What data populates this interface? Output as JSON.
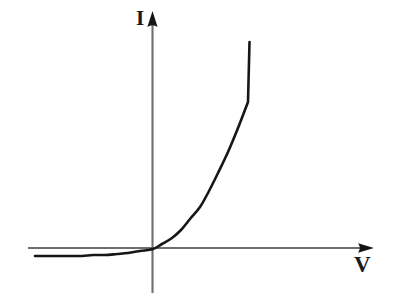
{
  "figure": {
    "title": "",
    "background_color": "#ffffff",
    "width": 394,
    "height": 301
  },
  "axes": {
    "vertical": {
      "label": "I",
      "label_name": "current",
      "color": "#6e6e6e",
      "arrow": "up-arrowhead"
    },
    "horizontal": {
      "label": "V",
      "label_name": "voltage",
      "color": "#6e6e6e",
      "arrow": "right-arrowhead"
    }
  },
  "curve": {
    "name": "diode-iv-characteristic",
    "color": "#161616",
    "stroke_width": 2.6
  },
  "chart_data": {
    "type": "line",
    "title": "",
    "xlabel": "V",
    "ylabel": "I",
    "xlim": [
      -1.05,
      1.1
    ],
    "ylim": [
      -0.12,
      1.05
    ],
    "grid": false,
    "legend": null,
    "origin_px": [
      153,
      249
    ],
    "annotations": [
      {
        "text": "I",
        "x_px": 142,
        "y_px": 18
      },
      {
        "text": "V",
        "x_px": 362,
        "y_px": 266
      }
    ],
    "series": [
      {
        "name": "Diode I-V curve",
        "x": [
          -1.0,
          -0.9,
          -0.8,
          -0.7,
          -0.6,
          -0.5,
          -0.4,
          -0.3,
          -0.2,
          -0.1,
          0.0,
          0.08,
          0.16,
          0.24,
          0.32,
          0.4,
          0.48,
          0.56,
          0.64,
          0.72,
          0.8
        ],
        "y": [
          -0.062,
          -0.062,
          -0.061,
          -0.06,
          -0.058,
          -0.055,
          -0.05,
          -0.043,
          -0.032,
          -0.018,
          0.0,
          0.03,
          0.072,
          0.126,
          0.196,
          0.282,
          0.386,
          0.51,
          0.655,
          0.82,
          1.0
        ],
        "points_px": [
          [
            35,
            256
          ],
          [
            47,
            256
          ],
          [
            58,
            256
          ],
          [
            70,
            256
          ],
          [
            82,
            256
          ],
          [
            93,
            255
          ],
          [
            105,
            255
          ],
          [
            117,
            254
          ],
          [
            128,
            253
          ],
          [
            140,
            251
          ],
          [
            153,
            249
          ],
          [
            162,
            244
          ],
          [
            172,
            238
          ],
          [
            181,
            230
          ],
          [
            190,
            219
          ],
          [
            200,
            207
          ],
          [
            209,
            191
          ],
          [
            218,
            173
          ],
          [
            228,
            152
          ],
          [
            238,
            128
          ],
          [
            248,
            102
          ]
        ]
      }
    ]
  }
}
